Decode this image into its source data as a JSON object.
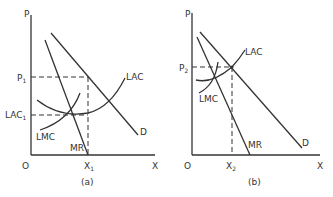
{
  "panels": [
    {
      "id": "a",
      "caption": "(a)",
      "axis_labels": {
        "y": "P",
        "x": "X",
        "origin": "O"
      },
      "price_label": "P",
      "price_sub": "1",
      "cost_label": "LAC",
      "cost_sub": "1",
      "quantity_label": "X",
      "quantity_sub": "1",
      "curves": {
        "lac": "LAC",
        "lmc": "LMC",
        "mr": "MR",
        "d": "D"
      }
    },
    {
      "id": "b",
      "caption": "(b)",
      "axis_labels": {
        "y": "P",
        "x": "X",
        "origin": "O"
      },
      "price_label": "P",
      "price_sub": "2",
      "quantity_label": "X",
      "quantity_sub": "2",
      "curves": {
        "lac": "LAC",
        "lmc": "LMC",
        "mr": "MR",
        "d": "D"
      }
    }
  ]
}
